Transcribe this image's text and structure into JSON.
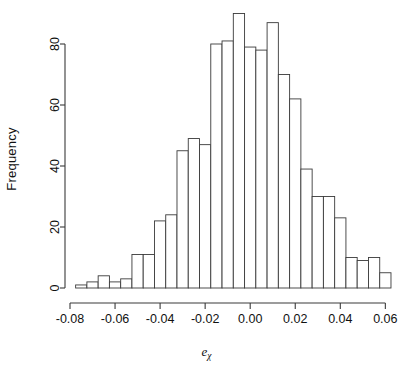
{
  "chart_data": {
    "type": "bar",
    "subtype": "histogram",
    "title": "",
    "xlabel": "e_chi",
    "xlabel_base": "e",
    "xlabel_subscript": "χ",
    "ylabel": "Frequency",
    "xlim": [
      -0.0775,
      0.0625
    ],
    "ylim": [
      0,
      90
    ],
    "grid": false,
    "legend": null,
    "bin_width": 0.005,
    "x_ticks": [
      -0.08,
      -0.06,
      -0.04,
      -0.02,
      0.0,
      0.02,
      0.04,
      0.06
    ],
    "x_tick_labels": [
      "-0.08",
      "-0.06",
      "-0.04",
      "-0.02",
      "0.00",
      "0.02",
      "0.04",
      "0.06"
    ],
    "y_ticks": [
      0,
      20,
      40,
      60,
      80
    ],
    "y_tick_labels": [
      "0",
      "20",
      "40",
      "60",
      "80"
    ],
    "bin_edges": [
      -0.0775,
      -0.0725,
      -0.0675,
      -0.0625,
      -0.0575,
      -0.0525,
      -0.0475,
      -0.0425,
      -0.0375,
      -0.0325,
      -0.0275,
      -0.0225,
      -0.0175,
      -0.0125,
      -0.0075,
      -0.0025,
      0.0025,
      0.0075,
      0.0125,
      0.0175,
      0.0225,
      0.0275,
      0.0325,
      0.0375,
      0.0425,
      0.0475,
      0.0525,
      0.0575,
      0.0625
    ],
    "bin_centers": [
      -0.075,
      -0.07,
      -0.065,
      -0.06,
      -0.055,
      -0.05,
      -0.045,
      -0.04,
      -0.035,
      -0.03,
      -0.025,
      -0.02,
      -0.015,
      -0.01,
      -0.005,
      0.0,
      0.005,
      0.01,
      0.015,
      0.02,
      0.025,
      0.03,
      0.035,
      0.04,
      0.045,
      0.05,
      0.055,
      0.06
    ],
    "categories": [
      "-0.075",
      "-0.070",
      "-0.065",
      "-0.060",
      "-0.055",
      "-0.050",
      "-0.045",
      "-0.040",
      "-0.035",
      "-0.030",
      "-0.025",
      "-0.020",
      "-0.015",
      "-0.010",
      "-0.005",
      "0.000",
      "0.005",
      "0.010",
      "0.015",
      "0.020",
      "0.025",
      "0.030",
      "0.035",
      "0.040",
      "0.045",
      "0.050",
      "0.055",
      "0.060"
    ],
    "values": [
      1,
      2,
      4,
      2,
      3,
      11,
      11,
      22,
      24,
      45,
      49,
      47,
      80,
      81,
      90,
      79,
      78,
      87,
      70,
      62,
      39,
      30,
      30,
      23,
      10,
      9,
      10,
      5
    ],
    "bar_fill": "#ffffff",
    "bar_stroke": "#3a3a3a",
    "axis_color": "#3a3a3a"
  },
  "axes": {
    "y_label": "Frequency",
    "x_label_base": "e",
    "x_label_sub": "χ"
  }
}
